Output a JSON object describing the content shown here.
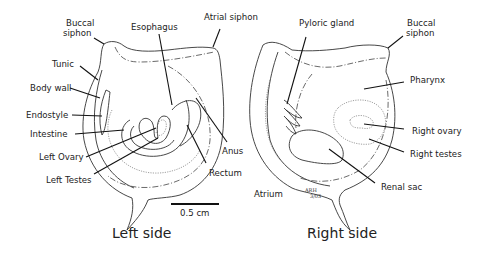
{
  "left_diagram": {
    "caption": "Left side",
    "labels": {
      "buccal_siphon_1": "Buccal",
      "buccal_siphon_2": "siphon",
      "esophagus": "Esophagus",
      "tunic": "Tunic",
      "body_wall": "Body wall",
      "endostyle": "Endostyle",
      "intestine": "Intestine",
      "left_ovary": "Left Ovary",
      "left_testes": "Left Testes",
      "anus": "Anus",
      "rectum": "Rectum"
    }
  },
  "right_diagram": {
    "caption": "Right side",
    "labels": {
      "atrial_siphon": "Atrial siphon",
      "pyloric_gland": "Pyloric gland",
      "buccal_siphon_1": "Buccal",
      "buccal_siphon_2": "siphon",
      "pharynx": "Pharynx",
      "right_ovary": "Right ovary",
      "right_testes": "Right testes",
      "renal_sac": "Renal sac",
      "atrium": "Atrium"
    },
    "signature_1": "ARH",
    "signature_2": "3/03"
  },
  "scale_bar": {
    "label": "0.5 cm"
  }
}
